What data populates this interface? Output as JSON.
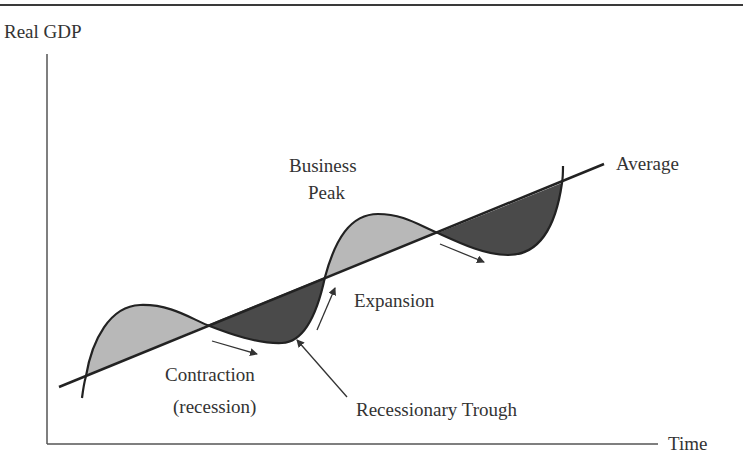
{
  "diagram": {
    "y_axis_label": "Real GDP",
    "x_axis_label": "Time",
    "trend_line_label": "Average",
    "labels": {
      "peak_line1": "Business",
      "peak_line2": "Peak",
      "expansion": "Expansion",
      "contraction_line1": "Contraction",
      "contraction_line2": "(recession)",
      "trough": "Recessionary Trough"
    },
    "colors": {
      "line": "#222222",
      "above_trend_fill": "#b8b8b8",
      "below_trend_fill": "#4a4a4a",
      "text": "#333333",
      "arrow": "#333333"
    }
  }
}
